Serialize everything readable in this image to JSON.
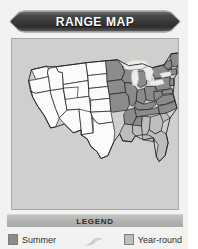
{
  "card": {
    "title": "RANGE MAP",
    "background_color": "#f2f2f0"
  },
  "banner": {
    "label": "RANGE MAP",
    "fill_dark": "#3a3a3a",
    "text_color": "#ffffff"
  },
  "map_panel": {
    "background_color": "#cfcfcd",
    "border_color": "#a9a9a7",
    "region": "Continental United States",
    "summer_color": "#8b8b89",
    "year_round_color": "#bdbdbb",
    "absent_color": "#fbfbf9",
    "outline_color": "#1f1f1f",
    "lake_color": "#ececea"
  },
  "legend": {
    "bar_label": "LEGEND",
    "bird_icon": "bird-silhouette-icon",
    "items": [
      {
        "label": "Summer",
        "swatch_color": "#8b8b89",
        "key": "summer"
      },
      {
        "label": "Year-round",
        "swatch_color": "#bdbdbb",
        "key": "year-round"
      }
    ]
  }
}
